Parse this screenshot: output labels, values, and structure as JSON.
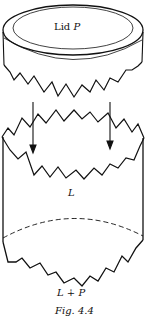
{
  "figure": {
    "lid_label_prefix": "Lid ",
    "lid_label_var": "P",
    "body_label": "L",
    "sum_label": "L ∔ P",
    "caption": "Fig. 4.4"
  },
  "colors": {
    "stroke": "#111111",
    "background": "#ffffff"
  }
}
